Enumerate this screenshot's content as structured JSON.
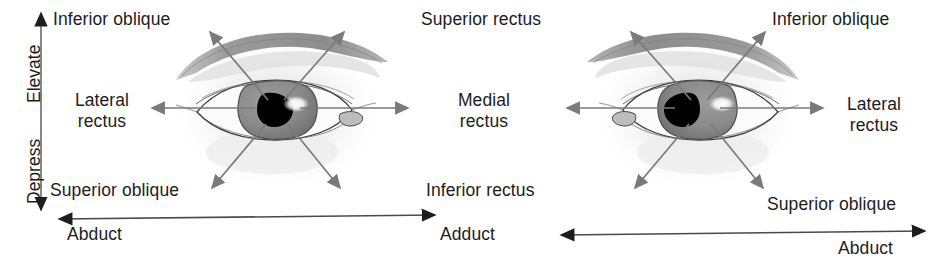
{
  "figure": {
    "kind": "anatomical-diagram",
    "background_color": "#ffffff",
    "text_color": "#1c1c1c",
    "arrow_color": "#6b6b6b",
    "axis_color": "#2b2b2b",
    "iris_color": "#8a8a8a",
    "pupil_color": "#000000",
    "eyebrow_color": "#9d9d9d",
    "skin_shadow_color": "#ebebeb"
  },
  "axes": {
    "vertical": {
      "elevate_label": "Elevate",
      "depress_label": "Depress",
      "double_headed": true
    },
    "horizontal_left": {
      "label": "Abduct",
      "label_right": "Adduct",
      "double_headed": true
    },
    "horizontal_right": {
      "label_left": "Adduct",
      "label": "Abduct",
      "double_headed": true
    }
  },
  "left_eye": {
    "name": "left-eye",
    "caruncle_side": "right",
    "labels": {
      "upper_outer": "Inferior oblique",
      "outer": "Lateral\nrectus",
      "lower_outer": "Superior oblique",
      "upper_inner": "Superior rectus",
      "inner": "Medial\nrectus",
      "lower_inner": "Inferior rectus"
    }
  },
  "right_eye": {
    "name": "right-eye",
    "caruncle_side": "left",
    "labels": {
      "upper_inner": "Superior rectus",
      "inner": "Medial\nrectus",
      "lower_inner": "Inferior rectus",
      "upper_outer": "Inferior oblique",
      "outer": "Lateral\nrectus",
      "lower_outer": "Superior oblique"
    }
  },
  "shared_center_labels": {
    "superior_rectus": "Superior rectus",
    "medial_rectus_line1": "Medial",
    "medial_rectus_line2": "rectus",
    "inferior_rectus": "Inferior rectus",
    "adduct": "Adduct"
  },
  "left_panel_labels": {
    "inferior_oblique": "Inferior oblique",
    "lateral_rectus_line1": "Lateral",
    "lateral_rectus_line2": "rectus",
    "superior_oblique": "Superior oblique",
    "abduct": "Abduct",
    "elevate": "Elevate",
    "depress": "Depress"
  },
  "right_panel_labels": {
    "inferior_oblique": "Inferior oblique",
    "lateral_rectus_line1": "Lateral",
    "lateral_rectus_line2": "rectus",
    "superior_oblique": "Superior oblique",
    "abduct": "Abduct"
  }
}
